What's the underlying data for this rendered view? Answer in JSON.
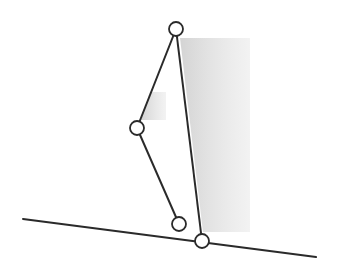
{
  "diagram": {
    "type": "linkage-mechanism",
    "canvas": {
      "width": 344,
      "height": 273,
      "background": "#ffffff"
    },
    "colors": {
      "stroke": "#2a2a2a",
      "node_fill": "#ffffff",
      "shade": "#d8d8d8"
    },
    "ground_line": {
      "x1": 23,
      "y1": 219,
      "x2": 316,
      "y2": 257
    },
    "nodes": [
      {
        "id": "top-joint",
        "cx": 176,
        "cy": 29,
        "r": 7
      },
      {
        "id": "middle-joint",
        "cx": 137,
        "cy": 128,
        "r": 7
      },
      {
        "id": "lower-joint",
        "cx": 179,
        "cy": 224,
        "r": 7
      },
      {
        "id": "ground-joint",
        "cx": 202,
        "cy": 241,
        "r": 7
      }
    ],
    "links": [
      {
        "id": "upper-left-bar",
        "from": "top-joint",
        "to": "middle-joint"
      },
      {
        "id": "lower-left-bar",
        "from": "middle-joint",
        "to": "lower-joint"
      },
      {
        "id": "long-right-bar",
        "from": "top-joint",
        "to": "ground-joint"
      }
    ],
    "shaded_regions": [
      {
        "id": "main-shadow",
        "points": "180,38 250,38 250,232 203,232"
      },
      {
        "id": "small-shadow",
        "points": "150,92 166,92 166,120 141,120"
      }
    ]
  }
}
